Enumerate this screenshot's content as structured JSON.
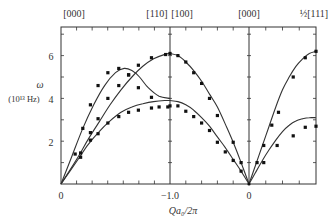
{
  "chart_data": {
    "type": "line",
    "title": "",
    "xlabel": "Qa₀/2π",
    "ylabel": "ω",
    "ylabel_units": "(10¹³ Hz)",
    "ylim": [
      0,
      7.3
    ],
    "y_ticks": [
      2,
      4,
      6
    ],
    "y_minor_step": 1,
    "bottom_tick_labels": [
      "0",
      "−1.0",
      "0"
    ],
    "top_labels": [
      "[000]",
      "[110]",
      "[100]",
      "[000]",
      "½[111]"
    ],
    "grid": false,
    "legend": null,
    "segments": [
      {
        "name": "[000] to [110]",
        "x_range": [
          0,
          -1.0
        ],
        "curves": [
          {
            "name": "upper transverse branch",
            "x": [
              0,
              0.1,
              0.2,
              0.3,
              0.4,
              0.5,
              0.58,
              0.65,
              0.72,
              0.8,
              0.9,
              1.0
            ],
            "y": [
              0,
              1.3,
              2.6,
              3.7,
              4.6,
              5.2,
              5.4,
              5.3,
              5.0,
              4.5,
              4.1,
              4.0
            ]
          },
          {
            "name": "longitudinal branch",
            "x": [
              0,
              0.15,
              0.25,
              0.35,
              0.45,
              0.55,
              0.65,
              0.75,
              0.85,
              0.95,
              1.0
            ],
            "y": [
              0,
              1.2,
              2.1,
              2.9,
              3.7,
              4.4,
              5.0,
              5.5,
              5.85,
              6.05,
              6.1
            ]
          },
          {
            "name": "lower transverse branch",
            "x": [
              0,
              0.15,
              0.25,
              0.35,
              0.45,
              0.55,
              0.65,
              0.75,
              0.85,
              0.95,
              1.0
            ],
            "y": [
              0,
              1.1,
              1.85,
              2.45,
              2.95,
              3.35,
              3.6,
              3.75,
              3.85,
              3.9,
              3.9
            ]
          }
        ],
        "points": [
          {
            "x": 0.13,
            "y": 1.4
          },
          {
            "x": 0.2,
            "y": 2.6
          },
          {
            "x": 0.27,
            "y": 3.7
          },
          {
            "x": 0.34,
            "y": 4.6
          },
          {
            "x": 0.43,
            "y": 5.2
          },
          {
            "x": 0.53,
            "y": 5.4
          },
          {
            "x": 0.62,
            "y": 5.1
          },
          {
            "x": 0.71,
            "y": 4.5
          },
          {
            "x": 0.83,
            "y": 4.05
          },
          {
            "x": 0.18,
            "y": 1.45
          },
          {
            "x": 0.27,
            "y": 2.4
          },
          {
            "x": 0.34,
            "y": 3.05
          },
          {
            "x": 0.43,
            "y": 4.0
          },
          {
            "x": 0.53,
            "y": 4.6
          },
          {
            "x": 0.62,
            "y": 5.1
          },
          {
            "x": 0.71,
            "y": 5.55
          },
          {
            "x": 0.83,
            "y": 5.9
          },
          {
            "x": 0.96,
            "y": 6.05
          },
          {
            "x": 0.18,
            "y": 1.25
          },
          {
            "x": 0.27,
            "y": 2.05
          },
          {
            "x": 0.34,
            "y": 2.35
          },
          {
            "x": 0.43,
            "y": 2.85
          },
          {
            "x": 0.53,
            "y": 3.15
          },
          {
            "x": 0.62,
            "y": 3.35
          },
          {
            "x": 0.71,
            "y": 3.45
          },
          {
            "x": 0.83,
            "y": 3.55
          },
          {
            "x": 0.9,
            "y": 3.6
          },
          {
            "x": 0.98,
            "y": 3.6
          }
        ]
      },
      {
        "name": "[100] to [000]",
        "x_range": [
          -1.0,
          0
        ],
        "curves": [
          {
            "name": "longitudinal branch",
            "x": [
              0,
              0.1,
              0.2,
              0.3,
              0.4,
              0.5,
              0.6,
              0.7,
              0.8,
              0.9,
              1.0
            ],
            "y": [
              6.1,
              6.0,
              5.7,
              5.3,
              4.8,
              4.2,
              3.6,
              2.8,
              1.95,
              1.0,
              0
            ]
          },
          {
            "name": "transverse branch",
            "x": [
              0,
              0.1,
              0.2,
              0.3,
              0.4,
              0.5,
              0.6,
              0.7,
              0.8,
              0.9,
              1.0
            ],
            "y": [
              3.9,
              3.85,
              3.7,
              3.45,
              3.1,
              2.7,
              2.2,
              1.7,
              1.15,
              0.6,
              0
            ]
          }
        ],
        "points": [
          {
            "x": 0.0,
            "y": 6.1
          },
          {
            "x": 0.1,
            "y": 6.0
          },
          {
            "x": 0.2,
            "y": 5.7
          },
          {
            "x": 0.3,
            "y": 5.2
          },
          {
            "x": 0.4,
            "y": 4.7
          },
          {
            "x": 0.5,
            "y": 4.0
          },
          {
            "x": 0.6,
            "y": 3.2
          },
          {
            "x": 0.8,
            "y": 1.95
          },
          {
            "x": 0.9,
            "y": 1.0
          },
          {
            "x": 0.0,
            "y": 3.65
          },
          {
            "x": 0.1,
            "y": 3.65
          },
          {
            "x": 0.2,
            "y": 3.4
          },
          {
            "x": 0.3,
            "y": 3.15
          },
          {
            "x": 0.4,
            "y": 2.85
          },
          {
            "x": 0.5,
            "y": 2.5
          },
          {
            "x": 0.6,
            "y": 1.95
          },
          {
            "x": 0.7,
            "y": 1.5
          },
          {
            "x": 0.8,
            "y": 1.1
          },
          {
            "x": 0.9,
            "y": 0.6
          }
        ]
      },
      {
        "name": "[000] to ½[111]",
        "x_range": [
          0,
          0.5
        ],
        "curves": [
          {
            "name": "longitudinal branch",
            "x": [
              0,
              0.1,
              0.2,
              0.3,
              0.4,
              0.5,
              0.6,
              0.7,
              0.8,
              0.9,
              1.0
            ],
            "y": [
              0,
              0.9,
              1.8,
              2.7,
              3.6,
              4.4,
              5.0,
              5.5,
              5.85,
              6.1,
              6.2
            ]
          },
          {
            "name": "transverse branch",
            "x": [
              0,
              0.1,
              0.2,
              0.3,
              0.4,
              0.5,
              0.6,
              0.7,
              0.8,
              0.9,
              1.0
            ],
            "y": [
              0,
              0.55,
              1.1,
              1.6,
              2.05,
              2.45,
              2.75,
              2.95,
              3.05,
              3.1,
              3.1
            ]
          }
        ],
        "points": [
          {
            "x": 0.12,
            "y": 1.0
          },
          {
            "x": 0.22,
            "y": 1.8
          },
          {
            "x": 0.34,
            "y": 2.75
          },
          {
            "x": 0.44,
            "y": 3.35
          },
          {
            "x": 0.66,
            "y": 5.0
          },
          {
            "x": 0.84,
            "y": 5.9
          },
          {
            "x": 1.0,
            "y": 6.2
          },
          {
            "x": 0.22,
            "y": 1.0
          },
          {
            "x": 0.42,
            "y": 1.8
          },
          {
            "x": 0.66,
            "y": 2.25
          },
          {
            "x": 0.84,
            "y": 2.65
          },
          {
            "x": 1.0,
            "y": 2.7
          }
        ]
      }
    ]
  },
  "layout_px": {
    "plot_left": 61,
    "plot_right": 316,
    "plot_top": 27,
    "plot_bottom": 184,
    "dividers": [
      170,
      249
    ],
    "px_per_unit_y": 21.4
  }
}
